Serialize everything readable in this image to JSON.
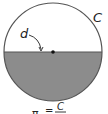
{
  "diagram": {
    "labels": {
      "circumference": "C",
      "diameter": "d",
      "formula_lhs": "π",
      "formula_eq": "=",
      "formula_num": "C",
      "formula_den": "d"
    },
    "colors": {
      "outline": "#555555",
      "fill_lower_half": "#8c8c8c",
      "background": "#ffffff",
      "center_dot": "#111111"
    }
  }
}
